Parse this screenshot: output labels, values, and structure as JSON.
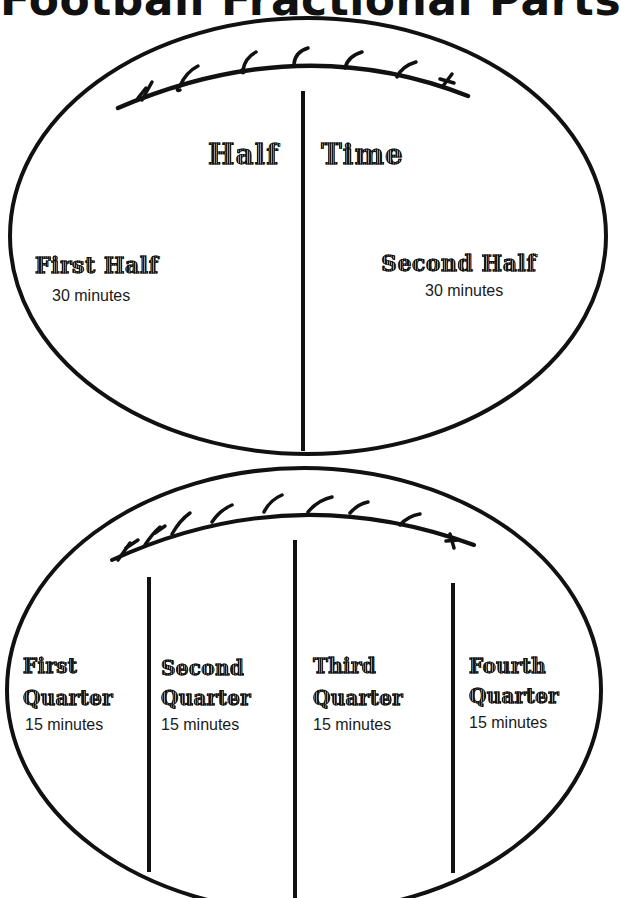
{
  "title": "Football Fractional Parts",
  "halves_diagram": {
    "header_left": "Half",
    "header_right": "Time",
    "parts": [
      {
        "label": "First Half",
        "duration": "30 minutes"
      },
      {
        "label": "Second Half",
        "duration": "30 minutes"
      }
    ]
  },
  "quarters_diagram": {
    "parts": [
      {
        "label_line1": "First",
        "label_line2": "Quarter",
        "duration": "15 minutes"
      },
      {
        "label_line1": "Second",
        "label_line2": "Quarter",
        "duration": "15 minutes"
      },
      {
        "label_line1": "Third",
        "label_line2": "Quarter",
        "duration": "15 minutes"
      },
      {
        "label_line1": "Fourth",
        "label_line2": "Quarter",
        "duration": "15 minutes"
      }
    ]
  },
  "colors": {
    "ink": "#111111",
    "background": "#ffffff"
  }
}
